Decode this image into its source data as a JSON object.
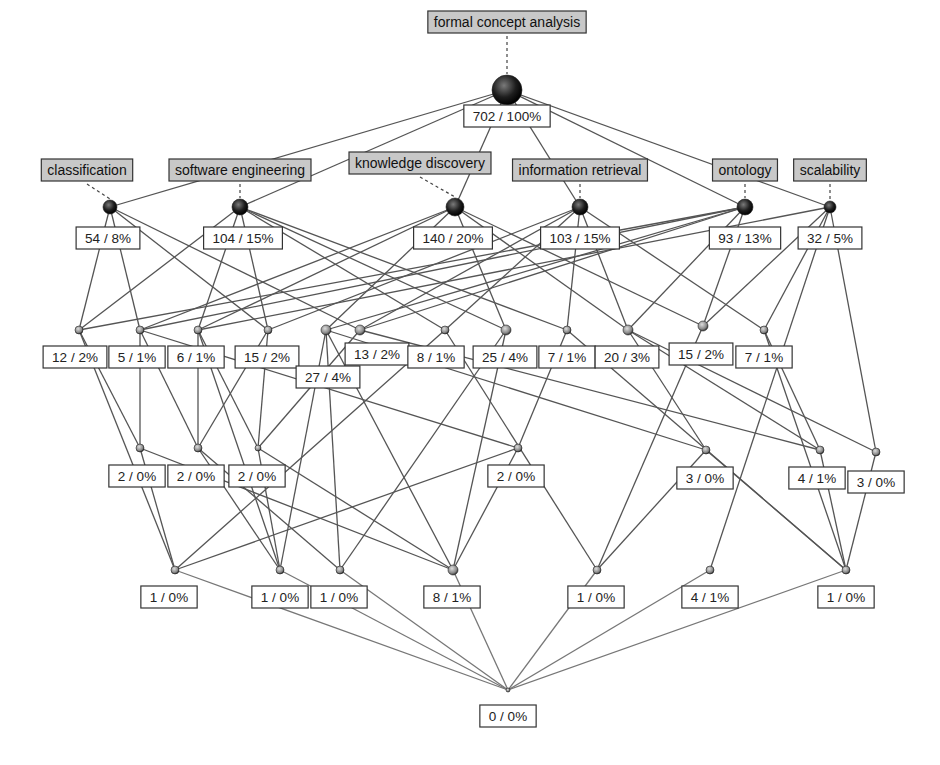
{
  "diagram": {
    "type": "concept-lattice",
    "title": "formal concept analysis",
    "colors": {
      "edge": "#555555",
      "attribute_label_fill": "#c8c8c8",
      "extent_label_fill": "#ffffff",
      "node_dark": "#1e1e1e",
      "node_light": "#888888"
    },
    "nodes": [
      {
        "id": "top",
        "extent": "702 / 100%",
        "attribute": "formal concept analysis"
      },
      {
        "id": "c1",
        "extent": "54 / 8%",
        "attribute": "classification"
      },
      {
        "id": "c2",
        "extent": "104 / 15%",
        "attribute": "software engineering"
      },
      {
        "id": "c3",
        "extent": "140 / 20%",
        "attribute": "knowledge discovery"
      },
      {
        "id": "c4",
        "extent": "103 / 15%",
        "attribute": "information retrieval"
      },
      {
        "id": "c5",
        "extent": "93 / 13%",
        "attribute": "ontology"
      },
      {
        "id": "c6",
        "extent": "32 / 5%",
        "attribute": "scalability"
      },
      {
        "id": "m1",
        "extent": "12 / 2%"
      },
      {
        "id": "m2",
        "extent": "5 / 1%"
      },
      {
        "id": "m3",
        "extent": "6 / 1%"
      },
      {
        "id": "m4",
        "extent": "15 / 2%"
      },
      {
        "id": "m5",
        "extent": "27 / 4%"
      },
      {
        "id": "m6",
        "extent": "13 / 2%"
      },
      {
        "id": "m7",
        "extent": "8 / 1%"
      },
      {
        "id": "m8",
        "extent": "25 / 4%"
      },
      {
        "id": "m9",
        "extent": "7 / 1%"
      },
      {
        "id": "m10",
        "extent": "20 / 3%"
      },
      {
        "id": "m11",
        "extent": "15 / 2%"
      },
      {
        "id": "m12",
        "extent": "7 / 1%"
      },
      {
        "id": "t1",
        "extent": "2 / 0%"
      },
      {
        "id": "t2",
        "extent": "2 / 0%"
      },
      {
        "id": "t3",
        "extent": "2 / 0%"
      },
      {
        "id": "t4",
        "extent": "2 / 0%"
      },
      {
        "id": "t5",
        "extent": "3 / 0%"
      },
      {
        "id": "t6",
        "extent": "4 / 1%"
      },
      {
        "id": "t7",
        "extent": "3 / 0%"
      },
      {
        "id": "b1",
        "extent": "1 / 0%"
      },
      {
        "id": "b2",
        "extent": "1 / 0%"
      },
      {
        "id": "b3",
        "extent": "1 / 0%"
      },
      {
        "id": "b4",
        "extent": "8 / 1%"
      },
      {
        "id": "b5",
        "extent": "1 / 0%"
      },
      {
        "id": "b6",
        "extent": "4 / 1%"
      },
      {
        "id": "b7",
        "extent": "1 / 0%"
      },
      {
        "id": "bottom",
        "extent": "0 / 0%"
      }
    ],
    "edges": [
      [
        "top",
        "c1"
      ],
      [
        "top",
        "c2"
      ],
      [
        "top",
        "c3"
      ],
      [
        "top",
        "c4"
      ],
      [
        "top",
        "c5"
      ],
      [
        "top",
        "c6"
      ],
      [
        "c1",
        "m1"
      ],
      [
        "c1",
        "m2"
      ],
      [
        "c1",
        "m4"
      ],
      [
        "c1",
        "m6"
      ],
      [
        "c2",
        "m1"
      ],
      [
        "c2",
        "m3"
      ],
      [
        "c2",
        "m4"
      ],
      [
        "c2",
        "m7"
      ],
      [
        "c2",
        "m8"
      ],
      [
        "c2",
        "m9"
      ],
      [
        "c3",
        "m2"
      ],
      [
        "c3",
        "m5"
      ],
      [
        "c3",
        "m8"
      ],
      [
        "c3",
        "m10"
      ],
      [
        "c3",
        "m11"
      ],
      [
        "c3",
        "m3"
      ],
      [
        "c4",
        "m4"
      ],
      [
        "c4",
        "m6"
      ],
      [
        "c4",
        "m9"
      ],
      [
        "c4",
        "m10"
      ],
      [
        "c4",
        "m12"
      ],
      [
        "c4",
        "m7"
      ],
      [
        "c5",
        "m1"
      ],
      [
        "c5",
        "m2"
      ],
      [
        "c5",
        "m5"
      ],
      [
        "c5",
        "m10"
      ],
      [
        "c5",
        "m11"
      ],
      [
        "c5",
        "m6"
      ],
      [
        "c6",
        "m3"
      ],
      [
        "c6",
        "m11"
      ],
      [
        "c6",
        "m12"
      ],
      [
        "c6",
        "t7"
      ],
      [
        "c6",
        "b6"
      ],
      [
        "m1",
        "t1"
      ],
      [
        "m1",
        "b1"
      ],
      [
        "m2",
        "t1"
      ],
      [
        "m2",
        "t2"
      ],
      [
        "m2",
        "t4"
      ],
      [
        "m3",
        "t2"
      ],
      [
        "m3",
        "t3"
      ],
      [
        "m3",
        "b2"
      ],
      [
        "m4",
        "t2"
      ],
      [
        "m4",
        "t3"
      ],
      [
        "m5",
        "b2"
      ],
      [
        "m5",
        "b4"
      ],
      [
        "m5",
        "b3"
      ],
      [
        "m5",
        "t5"
      ],
      [
        "m6",
        "t3"
      ],
      [
        "m6",
        "t6"
      ],
      [
        "m7",
        "b1"
      ],
      [
        "m7",
        "b5"
      ],
      [
        "m8",
        "b4"
      ],
      [
        "m8",
        "b3"
      ],
      [
        "m9",
        "t4"
      ],
      [
        "m9",
        "b7"
      ],
      [
        "m10",
        "t5"
      ],
      [
        "m10",
        "t6"
      ],
      [
        "m10",
        "t7"
      ],
      [
        "m11",
        "b5"
      ],
      [
        "m12",
        "t6"
      ],
      [
        "m12",
        "b7"
      ],
      [
        "t1",
        "b1"
      ],
      [
        "t1",
        "b4"
      ],
      [
        "t2",
        "b2"
      ],
      [
        "t2",
        "b3"
      ],
      [
        "t3",
        "b2"
      ],
      [
        "t3",
        "b4"
      ],
      [
        "t4",
        "b4"
      ],
      [
        "t4",
        "b1"
      ],
      [
        "t5",
        "b7"
      ],
      [
        "t5",
        "b5"
      ],
      [
        "t6",
        "b7"
      ],
      [
        "t7",
        "b7"
      ],
      [
        "b1",
        "bottom"
      ],
      [
        "b2",
        "bottom"
      ],
      [
        "b3",
        "bottom"
      ],
      [
        "b4",
        "bottom"
      ],
      [
        "b5",
        "bottom"
      ],
      [
        "b6",
        "bottom"
      ],
      [
        "b7",
        "bottom"
      ]
    ]
  }
}
